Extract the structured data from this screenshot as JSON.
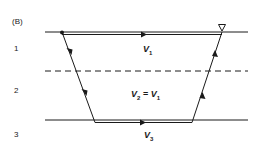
{
  "figure": {
    "panel_label": "(B)",
    "layers": [
      {
        "number": "1",
        "velocity_symbol": "V",
        "velocity_sub": "1",
        "velocity_text": "V1"
      },
      {
        "number": "2",
        "velocity_symbol": "V",
        "velocity_sub": "2",
        "relation": "=",
        "relation_rhs_symbol": "V",
        "relation_rhs_sub": "1",
        "velocity_text": "V2 = V1"
      },
      {
        "number": "3",
        "velocity_symbol": "V",
        "velocity_sub": "3",
        "velocity_text": "V3"
      }
    ],
    "boundaries": [
      {
        "name": "surface",
        "style": "solid"
      },
      {
        "name": "layer1-layer2",
        "style": "dashed"
      },
      {
        "name": "layer2-layer3",
        "style": "solid"
      }
    ],
    "receiver_icon": "inverted-triangle",
    "ray_path": "source -> down through layers 1 and 2 -> refracted along top of layer 3 -> up through layers 2 and 1 -> receiver",
    "colors": {
      "line": "#1a1a1a",
      "background": "#ffffff"
    }
  }
}
